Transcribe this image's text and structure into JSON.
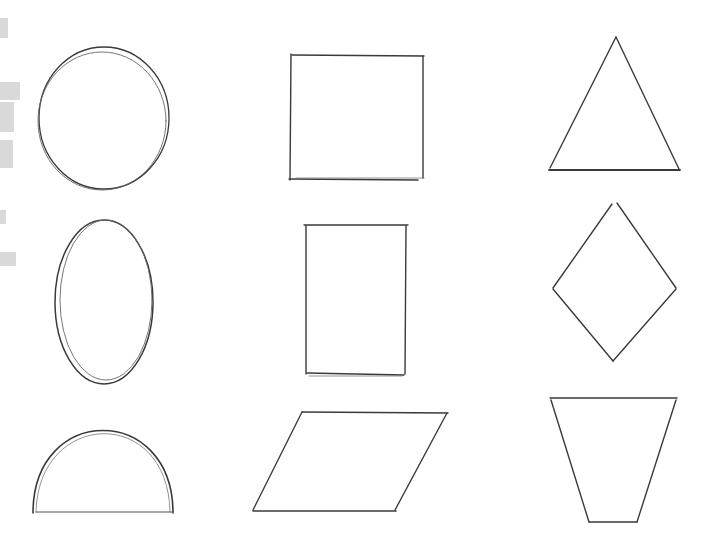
{
  "colors": {
    "background": "#ffffff",
    "stroke_dark": "#3a3a3a",
    "stroke_light": "#6a6a6a",
    "smudge": "#d6d6d6"
  },
  "grid": {
    "rows": 3,
    "columns": 3
  },
  "shapes": [
    {
      "name": "circle",
      "row": 1,
      "col": 1,
      "cx": 104,
      "cy": 118,
      "rx": 66,
      "ry": 71
    },
    {
      "name": "square",
      "row": 1,
      "col": 2,
      "x": 290,
      "y": 55,
      "w": 134,
      "h": 125
    },
    {
      "name": "triangle",
      "row": 1,
      "col": 3,
      "points": [
        [
          616,
          37
        ],
        [
          680,
          170
        ],
        [
          549,
          170
        ]
      ]
    },
    {
      "name": "ellipse",
      "row": 2,
      "col": 1,
      "cx": 104,
      "cy": 302,
      "rx": 48,
      "ry": 82
    },
    {
      "name": "rectangle",
      "row": 2,
      "col": 2,
      "x": 306,
      "y": 225,
      "w": 101,
      "h": 150
    },
    {
      "name": "diamond",
      "row": 2,
      "col": 3,
      "points": [
        [
          614,
          203
        ],
        [
          676,
          288
        ],
        [
          613,
          361
        ],
        [
          553,
          288
        ]
      ]
    },
    {
      "name": "semicircle",
      "row": 3,
      "col": 1,
      "cx": 102,
      "cy": 512,
      "rx": 70,
      "ry": 80
    },
    {
      "name": "parallelogram",
      "row": 3,
      "col": 2,
      "points": [
        [
          303,
          412
        ],
        [
          448,
          412
        ],
        [
          395,
          511
        ],
        [
          253,
          511
        ]
      ]
    },
    {
      "name": "trapezoid",
      "row": 3,
      "col": 3,
      "points": [
        [
          550,
          398
        ],
        [
          677,
          398
        ],
        [
          637,
          522
        ],
        [
          589,
          522
        ]
      ]
    }
  ]
}
